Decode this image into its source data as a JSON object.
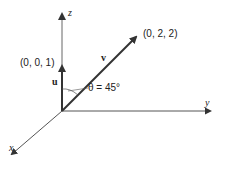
{
  "diagram": {
    "title": "",
    "axes": {
      "x": {
        "label": "x"
      },
      "y": {
        "label": "y"
      },
      "z": {
        "label": "z"
      }
    },
    "vectors": [
      {
        "name": "u",
        "label": "u",
        "endpoint_label": "(0, 0, 1)",
        "components": [
          0,
          0,
          1
        ]
      },
      {
        "name": "v",
        "label": "v",
        "endpoint_label": "(0, 2, 2)",
        "components": [
          0,
          2,
          2
        ]
      }
    ],
    "angle": {
      "label": "θ = 45°",
      "value_degrees": 45
    },
    "colors": {
      "axis": "#555555",
      "vector": "#333333",
      "text": "#222222"
    }
  }
}
